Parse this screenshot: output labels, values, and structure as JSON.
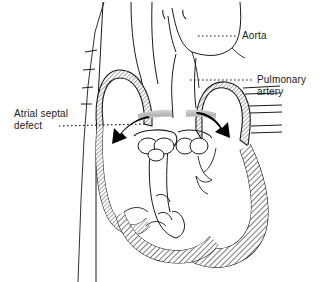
{
  "figure": {
    "type": "anatomical-line-diagram",
    "background_color": "#ffffff",
    "ink_color": "#1a1a1a",
    "wall_fill_color": "#9a9a9a",
    "septum_band_color": "#c0c0c0",
    "arrow_color": "#000000"
  },
  "labels": {
    "aorta": {
      "text": "Aorta",
      "leader": "dotted"
    },
    "pulmonary_artery": {
      "line1": "Pulmonary",
      "line2": "artery",
      "leader": "dotted"
    },
    "atrial_septal_defect": {
      "line1": "Atrial septal",
      "line2": "defect",
      "leader": "dotted"
    }
  },
  "annotations": {
    "shunt_arrow_left": "left-pointing-shunt-arrow",
    "shunt_arrow_right": "right-pointing-shunt-arrow",
    "septum_gap": "atrial-septal-defect-opening"
  },
  "structures": {
    "vena_cava": "vena-cava",
    "right_atrium": "right-atrium",
    "left_atrium": "left-atrium",
    "right_ventricle": "right-ventricle",
    "left_ventricle": "left-ventricle",
    "tricuspid_valve": "tricuspid-valve",
    "mitral_valve": "mitral-valve",
    "aorta_vessel": "aorta-vessel",
    "pulmonary_artery_vessel": "pulmonary-artery-vessel",
    "pulmonary_veins": "pulmonary-veins"
  }
}
